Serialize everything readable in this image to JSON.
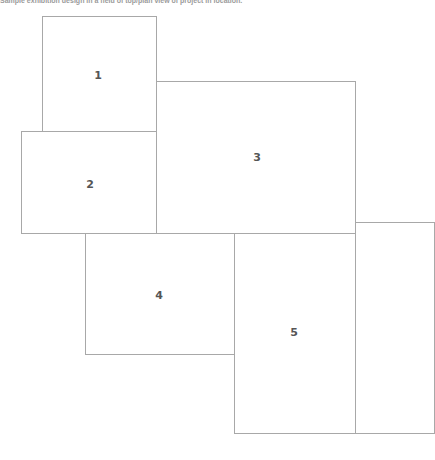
{
  "caption": "Sample exhibition design in a field of top/plan view of project in location.",
  "colors": {
    "background": "#ffffff",
    "box_border": "#a8a8a8",
    "label": "#555555"
  },
  "diagram": {
    "type": "floor-plan",
    "boxes": [
      {
        "id": "1",
        "label": "1",
        "x": 42,
        "y": 16,
        "w": 115,
        "h": 116,
        "label_x": 98,
        "label_y": 75
      },
      {
        "id": "2",
        "label": "2",
        "x": 21,
        "y": 131,
        "w": 136,
        "h": 103,
        "label_x": 90,
        "label_y": 184
      },
      {
        "id": "3",
        "label": "3",
        "x": 156,
        "y": 81,
        "w": 200,
        "h": 153,
        "label_x": 257,
        "label_y": 157
      },
      {
        "id": "4",
        "label": "4",
        "x": 85,
        "y": 233,
        "w": 150,
        "h": 122,
        "label_x": 159,
        "label_y": 295
      },
      {
        "id": "5",
        "label": "5",
        "x": 234,
        "y": 233,
        "w": 122,
        "h": 201,
        "label_x": 294,
        "label_y": 332
      },
      {
        "id": "6",
        "label": "",
        "x": 355,
        "y": 222,
        "w": 80,
        "h": 212,
        "label_x": null,
        "label_y": null
      }
    ]
  }
}
